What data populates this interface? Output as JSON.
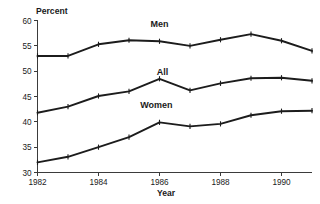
{
  "chart_data": {
    "type": "line",
    "title": "",
    "xlabel": "Year",
    "ylabel": "Percent",
    "xlim": [
      1982,
      1991
    ],
    "ylim": [
      30,
      60
    ],
    "ytick_values": [
      30,
      35,
      40,
      45,
      50,
      55,
      60
    ],
    "ytick_labels": [
      "30",
      "35",
      "40",
      "45",
      "50",
      "55",
      "60"
    ],
    "xtick_values": [
      1982,
      1984,
      1986,
      1988,
      1990
    ],
    "xtick_labels": [
      "1982",
      "1984",
      "1986",
      "1988",
      "1990"
    ],
    "x": [
      1982,
      1983,
      1984,
      1985,
      1986,
      1987,
      1988,
      1989,
      1990,
      1991
    ],
    "grid": false,
    "legend": "inline-labels",
    "series": [
      {
        "name": "Men",
        "label": "Men",
        "values": [
          53.0,
          53.0,
          55.3,
          56.1,
          55.9,
          55.0,
          56.2,
          57.3,
          56.0,
          54.0
        ],
        "color": "#1c1c1c",
        "label_x": 1986.0,
        "label_y": 58.7
      },
      {
        "name": "All",
        "label": "All",
        "values": [
          41.8,
          43.0,
          45.1,
          46.0,
          48.5,
          46.2,
          47.6,
          48.6,
          48.7,
          48.1
        ],
        "color": "#1c1c1c",
        "label_x": 1986.1,
        "label_y": 49.2
      },
      {
        "name": "Women",
        "label": "Women",
        "values": [
          32.0,
          33.1,
          35.0,
          37.0,
          39.9,
          39.1,
          39.6,
          41.3,
          42.1,
          42.2
        ],
        "color": "#1c1c1c",
        "label_x": 1985.9,
        "label_y": 42.8
      }
    ]
  }
}
